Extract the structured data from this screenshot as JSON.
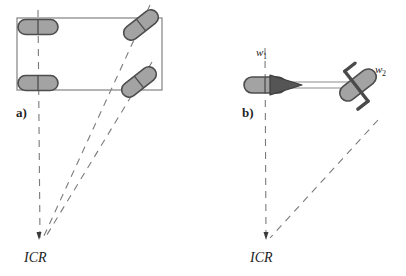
{
  "figure": {
    "title": "",
    "background_color": "#ffffff",
    "width": 406,
    "height": 276,
    "panels": [
      {
        "id": "a",
        "label": "a)",
        "label_pos": {
          "x": 16,
          "y": 117
        },
        "description": "Four-wheeled car-like vehicle with steered front wheels converging to an instantaneous centre of rotation",
        "icr": {
          "label": "ICR",
          "x": 24,
          "y": 262,
          "point_x": 40,
          "point_y": 238
        },
        "chassis": {
          "type": "rectangle",
          "x": 17,
          "y": 18,
          "width": 145,
          "height": 72,
          "stroke": "#8c8c8c",
          "fill": "none"
        },
        "wheels": [
          {
            "name": "rear-left-wheel",
            "cx": 38,
            "cy": 27,
            "length": 38,
            "width": 15,
            "angle": 0
          },
          {
            "name": "rear-right-wheel",
            "cx": 38,
            "cy": 83,
            "length": 38,
            "width": 15,
            "angle": 0
          },
          {
            "name": "front-left-wheel",
            "cx": 141,
            "cy": 25,
            "length": 38,
            "width": 15,
            "angle": -38
          },
          {
            "name": "front-right-wheel",
            "cx": 139,
            "cy": 82,
            "length": 38,
            "width": 15,
            "angle": -38
          }
        ],
        "axis_lines": [
          {
            "name": "rear-axis-dashed-line",
            "x1": 38,
            "y1": 10,
            "x2": 40,
            "y2": 238
          },
          {
            "name": "front-left-axis-dashed-line",
            "x1": 141,
            "y1": 12,
            "x2": 43,
            "y2": 238
          },
          {
            "name": "front-right-axis-dashed-line",
            "x1": 139,
            "y1": 69,
            "x2": 45,
            "y2": 238
          }
        ]
      },
      {
        "id": "b",
        "label": "b)",
        "label_pos": {
          "x": 242,
          "y": 117
        },
        "description": "Bicycle-like kinematic model: fixed rear wheel w1 and steerable front wheel w2 connected by a rigid body, axes converging at ICR",
        "icr": {
          "label": "ICR",
          "x": 250,
          "y": 262,
          "point_x": 266,
          "point_y": 238
        },
        "wheel_labels": [
          {
            "name": "wheel-label-w1",
            "base": "w",
            "sub": "1",
            "x": 258,
            "y": 56
          },
          {
            "name": "wheel-label-w2",
            "base": "w",
            "sub": "2",
            "x": 377,
            "y": 74
          }
        ],
        "wheels": [
          {
            "name": "rear-wheel-w1",
            "cx": 265,
            "cy": 85,
            "length": 40,
            "width": 16,
            "angle": 0
          },
          {
            "name": "front-wheel-w2",
            "cx": 358,
            "cy": 85,
            "length": 40,
            "width": 16,
            "angle": -38
          }
        ],
        "body": {
          "name": "chassis-rod",
          "x1": 286,
          "y1": 85,
          "x2": 352,
          "y2": 85,
          "stroke": "#8c8c8c"
        },
        "heading_arrow": {
          "name": "heading-arrow",
          "tip_x": 300,
          "tip_y": 85,
          "base_x": 269,
          "base_y": 85,
          "half_height": 11,
          "fill": "#555555"
        },
        "fork": {
          "name": "steering-fork",
          "stroke": "#4a4a4a",
          "angle": -38
        },
        "axis_lines": [
          {
            "name": "rear-axis-dashed-line",
            "x1": 265,
            "y1": 48,
            "x2": 266,
            "y2": 238
          },
          {
            "name": "front-axis-dashed-line",
            "x1": 372,
            "y1": 108,
            "x2": 270,
            "y2": 238
          }
        ]
      }
    ],
    "colors": {
      "wheel_fill": "#a3a3a3",
      "wheel_stroke": "#4d4d4d",
      "dash_stroke": "#7a7a7a",
      "frame_stroke": "#8c8c8c",
      "dark_part": "#4a4a4a",
      "text": "#1c1c1c"
    }
  }
}
